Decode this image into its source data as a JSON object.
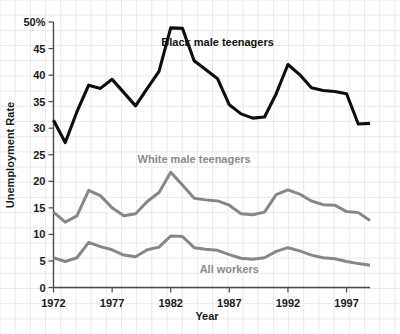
{
  "chart_data": {
    "type": "line",
    "title": "",
    "xlabel": "Year",
    "ylabel": "Unemployment Rate",
    "xlim": [
      1972,
      1999
    ],
    "ylim": [
      0,
      50
    ],
    "grid": true,
    "legend_position": "inline-annotations",
    "x": [
      1972,
      1973,
      1974,
      1975,
      1976,
      1977,
      1978,
      1979,
      1980,
      1981,
      1982,
      1983,
      1984,
      1985,
      1986,
      1987,
      1988,
      1989,
      1990,
      1991,
      1992,
      1993,
      1994,
      1995,
      1996,
      1997,
      1998,
      1999
    ],
    "y_ticks": [
      0,
      5,
      10,
      15,
      20,
      25,
      30,
      35,
      40,
      45,
      50
    ],
    "y_tick_labels": [
      "0",
      "5",
      "10",
      "15",
      "20",
      "25",
      "30",
      "35",
      "40",
      "45",
      "50%"
    ],
    "x_ticks": [
      1972,
      1977,
      1982,
      1987,
      1992,
      1997
    ],
    "x_tick_labels": [
      "1972",
      "1977",
      "1982",
      "1987",
      "1992",
      "1997"
    ],
    "series": [
      {
        "name": "Black male teenagers",
        "color": "#0d0d0d",
        "label_x": 1986,
        "label_y": 45.5,
        "values": [
          31.5,
          27.3,
          33.1,
          38.1,
          37.5,
          39.2,
          36.7,
          34.2,
          37.5,
          40.7,
          48.9,
          48.8,
          42.7,
          41.0,
          39.3,
          34.4,
          32.7,
          31.9,
          32.1,
          36.5,
          42.0,
          40.1,
          37.6,
          37.1,
          36.9,
          36.5,
          30.8,
          30.9
        ]
      },
      {
        "name": "White male teenagers",
        "color": "#878787",
        "label_x": 1984,
        "label_y": 23.5,
        "values": [
          14.2,
          12.3,
          13.5,
          18.3,
          17.3,
          15.0,
          13.5,
          13.9,
          16.2,
          17.9,
          21.7,
          19.3,
          16.8,
          16.5,
          16.3,
          15.5,
          13.9,
          13.7,
          14.2,
          17.5,
          18.4,
          17.6,
          16.3,
          15.6,
          15.5,
          14.3,
          14.1,
          12.6
        ]
      },
      {
        "name": "All workers",
        "color": "#878787",
        "label_x": 1987,
        "label_y": 2.8,
        "values": [
          5.6,
          4.9,
          5.6,
          8.5,
          7.7,
          7.1,
          6.1,
          5.8,
          7.1,
          7.6,
          9.7,
          9.6,
          7.5,
          7.2,
          7.0,
          6.2,
          5.5,
          5.3,
          5.6,
          6.8,
          7.5,
          6.9,
          6.1,
          5.6,
          5.4,
          4.9,
          4.5,
          4.2
        ]
      }
    ]
  }
}
